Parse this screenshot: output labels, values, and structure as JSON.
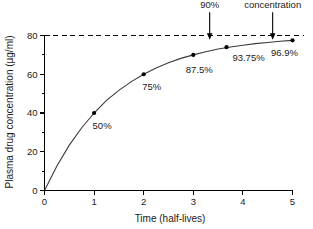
{
  "chart_data": {
    "type": "line",
    "title": "",
    "xlabel": "Time (half-lives)",
    "ylabel": "Plasma drug concentration (µg/ml)",
    "xlim": [
      0,
      5
    ],
    "ylim": [
      0,
      85
    ],
    "grid": false,
    "legend": null,
    "steady_state_value": 80,
    "x_ticks": [
      "0",
      "1",
      "2",
      "3",
      "4",
      "5"
    ],
    "x_tick_values": [
      0,
      1,
      2,
      3,
      4,
      5
    ],
    "y_ticks": [
      "0",
      "20",
      "40",
      "60",
      "80"
    ],
    "y_tick_values": [
      0,
      20,
      40,
      60,
      80
    ],
    "y_minor_tick_values": [
      10,
      30,
      50,
      70
    ],
    "series": [
      {
        "name": "Plasma drug concentration",
        "x": [
          0,
          0.25,
          0.5,
          0.75,
          1,
          1.25,
          1.5,
          1.75,
          2,
          2.25,
          2.5,
          2.75,
          3,
          3.25,
          3.5,
          3.75,
          4,
          4.25,
          4.5,
          4.75,
          5
        ],
        "y": [
          0,
          12.6,
          23.4,
          32.4,
          40,
          46.5,
          51.7,
          56.2,
          60,
          63.2,
          65.9,
          68.2,
          70,
          71.6,
          73.0,
          74.1,
          75,
          75.8,
          76.4,
          77.0,
          77.5
        ]
      }
    ],
    "points": [
      {
        "label": "50%",
        "x": 1,
        "y": 40,
        "label_dx": 8,
        "label_dy": 16
      },
      {
        "label": "75%",
        "x": 2,
        "y": 60,
        "label_dx": 8,
        "label_dy": 16
      },
      {
        "label": "87.5%",
        "x": 3,
        "y": 70,
        "label_dx": 6,
        "label_dy": 18
      },
      {
        "label": "93.75%",
        "x": 3.67,
        "y": 74.0,
        "label_dx": 22,
        "label_dy": 14
      },
      {
        "label": "96.9%",
        "x": 5,
        "y": 77.5,
        "label_dx": -8,
        "label_dy": 16
      }
    ],
    "annotations": [
      {
        "name": "ninety-percent",
        "label": "90%",
        "lines": [
          "90%"
        ],
        "x": 3.33,
        "arrow_to_y": 80,
        "arrow_from_y": 92
      },
      {
        "name": "steady-state",
        "label": "Steady-state concentration",
        "lines": [
          "Steady-state",
          "concentration"
        ],
        "x": 4.6,
        "arrow_to_y": 80,
        "arrow_from_y": 92
      }
    ]
  },
  "figure": {
    "background_color": "#ffffff",
    "curve_color": "#3a3a3a",
    "axis_color": "#000000",
    "marker_color": "#000000"
  }
}
